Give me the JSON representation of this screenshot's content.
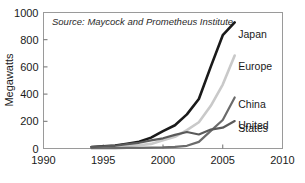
{
  "chart_data": {
    "type": "line",
    "title": "",
    "subtitle": "",
    "source_note": "Source: Maycock and Prometheus Institute",
    "xlabel": "",
    "ylabel": "Megawatts",
    "xlim": [
      1990,
      2010
    ],
    "ylim": [
      0,
      1000
    ],
    "xticks": [
      1990,
      1995,
      2000,
      2005,
      2010
    ],
    "yticks": [
      0,
      200,
      400,
      600,
      800,
      1000
    ],
    "xtick_labels": [
      "1990",
      "1995",
      "2000",
      "2005",
      "2010"
    ],
    "ytick_labels": [
      "0",
      "200",
      "400",
      "600",
      "800",
      "1000"
    ],
    "grid": false,
    "legend_position": "inline-right-of-series",
    "series": [
      {
        "name": "Japan",
        "color": "#1a1a1a",
        "width": 2.6,
        "label_x": 2006.3,
        "label_y": 845,
        "x": [
          1994,
          1995,
          1996,
          1997,
          1998,
          1999,
          2000,
          2001,
          2002,
          2003,
          2004,
          2005,
          2006
        ],
        "values": [
          10,
          16,
          21,
          35,
          49,
          80,
          128,
          171,
          251,
          364,
          602,
          833,
          927
        ]
      },
      {
        "name": "Europe",
        "color": "#c9c9c9",
        "width": 2.6,
        "label_x": 2006.3,
        "label_y": 610,
        "x": [
          1994,
          1995,
          1996,
          1997,
          1998,
          1999,
          2000,
          2001,
          2002,
          2003,
          2004,
          2005,
          2006
        ],
        "values": [
          6,
          9,
          13,
          19,
          24,
          34,
          60,
          86,
          135,
          193,
          314,
          470,
          684
        ]
      },
      {
        "name": "China",
        "color": "#6b6b6b",
        "width": 2.2,
        "label_x": 2006.3,
        "label_y": 330,
        "x": [
          1994,
          1995,
          1996,
          1997,
          1998,
          1999,
          2000,
          2001,
          2002,
          2003,
          2004,
          2005,
          2006
        ],
        "values": [
          2,
          2,
          3,
          4,
          5,
          6,
          8,
          12,
          20,
          49,
          130,
          210,
          375
        ]
      },
      {
        "name": "United States",
        "color": "#5a5a5a",
        "width": 2.2,
        "label_x": 2006.3,
        "label_y": 175,
        "label_line2_y": 148,
        "label_lines": [
          "United",
          "States"
        ],
        "x": [
          1994,
          1995,
          1996,
          1997,
          1998,
          1999,
          2000,
          2001,
          2002,
          2003,
          2004,
          2005,
          2006
        ],
        "values": [
          10,
          15,
          20,
          32,
          42,
          60,
          75,
          100,
          121,
          103,
          139,
          153,
          202
        ]
      }
    ]
  }
}
